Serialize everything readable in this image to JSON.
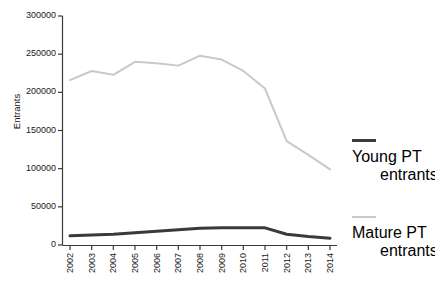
{
  "chart_data": {
    "type": "line",
    "title": "",
    "xlabel": "",
    "ylabel": "Entrants",
    "categories": [
      "2002",
      "2003",
      "2004",
      "2005",
      "2006",
      "2007",
      "2008",
      "2009",
      "2010",
      "2011",
      "2012",
      "2013",
      "2014"
    ],
    "ylim": [
      0,
      300000
    ],
    "yticks": [
      0,
      50000,
      100000,
      150000,
      200000,
      250000,
      300000
    ],
    "ytick_labels": [
      "0",
      "50000",
      "100000",
      "150000",
      "200000",
      "250000",
      "300000"
    ],
    "grid": false,
    "legend_position": "right",
    "series": [
      {
        "name": "Young PT entrants",
        "name_line1": "Young PT",
        "name_line2": "entrants",
        "color": "#3a3a3a",
        "width": 3,
        "values": [
          12000,
          13000,
          14000,
          16000,
          18000,
          20000,
          22000,
          22500,
          22500,
          22500,
          14000,
          11000,
          9000
        ]
      },
      {
        "name": "Mature PT entrants",
        "name_line1": "Mature PT",
        "name_line2": "entrants",
        "color": "#c9c9c9",
        "width": 2,
        "values": [
          216000,
          228000,
          223000,
          240000,
          238000,
          235000,
          248000,
          243000,
          228000,
          205000,
          136000,
          118000,
          99000
        ]
      }
    ]
  },
  "axis": {
    "y_label": "Entrants"
  },
  "legend": {
    "items": [
      {
        "line1": "Young PT",
        "line2": "entrants",
        "color": "#3a3a3a"
      },
      {
        "line1": "Mature PT",
        "line2": "entrants",
        "color": "#c9c9c9"
      }
    ]
  }
}
